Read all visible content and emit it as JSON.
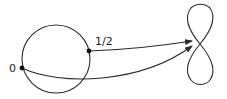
{
  "diagram": {
    "labels": {
      "zero": "0",
      "half": "1/2"
    },
    "elements": {
      "circle": {
        "cx": 56,
        "cy": 59,
        "r": 34
      },
      "point_zero": {
        "x": 22,
        "y": 68
      },
      "point_half": {
        "x": 89,
        "y": 51
      },
      "figure_eight": {
        "crossing": [
          200,
          44
        ],
        "top": 5,
        "bottom": 85
      },
      "arrows": [
        {
          "from": "point_half",
          "to": [
            192,
            41
          ]
        },
        {
          "from": "point_zero",
          "to": [
            192,
            46
          ]
        }
      ]
    },
    "colors": {
      "stroke": "#2a2a2a",
      "background": "#ffffff"
    }
  }
}
